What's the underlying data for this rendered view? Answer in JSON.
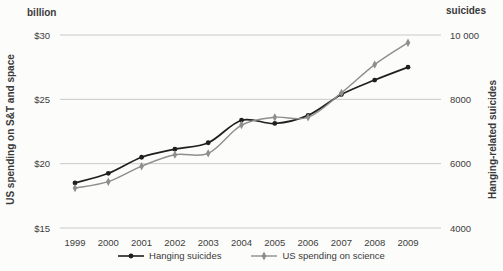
{
  "chart": {
    "left_axis": {
      "header": "billion",
      "title": "US spending on S&T and space",
      "min": 15,
      "max": 30,
      "ticks": [
        "$30",
        "$25",
        "$20",
        "$15"
      ]
    },
    "right_axis": {
      "header": "suicides",
      "title": "Hanging-related suicides",
      "min": 4000,
      "max": 10000,
      "ticks": [
        "10 000",
        "8000",
        "6000",
        "4000"
      ]
    },
    "colors": {
      "grid": "#c9c9c9",
      "text": "#3d3d3d",
      "hanging_series": "#1f1f1f",
      "spending_series": "#8e8e8e"
    }
  },
  "chart_data": {
    "type": "line",
    "x": [
      1999,
      2000,
      2001,
      2002,
      2003,
      2004,
      2005,
      2006,
      2007,
      2008,
      2009
    ],
    "series": [
      {
        "name": "Hanging suicides",
        "axis": "right",
        "marker": "circle",
        "color": "#1f1f1f",
        "values": [
          5400,
          5700,
          6200,
          6450,
          6650,
          7350,
          7250,
          7500,
          8150,
          8600,
          9000
        ]
      },
      {
        "name": "US spending on science",
        "axis": "left",
        "marker": "diamond",
        "color": "#8e8e8e",
        "values": [
          18.1,
          18.6,
          19.8,
          20.7,
          20.8,
          23.0,
          23.6,
          23.6,
          25.5,
          27.7,
          29.4
        ]
      }
    ],
    "title": "",
    "xlabel": "",
    "left_ylabel": "US spending on S&T and space",
    "right_ylabel": "Hanging-related suicides",
    "left_ylim": [
      15,
      30
    ],
    "right_ylim": [
      4000,
      10000
    ],
    "grid": "horizontal",
    "legend_position": "bottom"
  }
}
